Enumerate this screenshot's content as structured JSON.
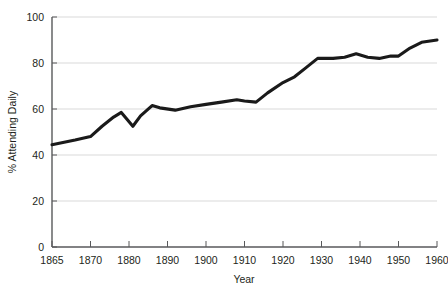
{
  "chart_data": {
    "type": "line",
    "title": "",
    "subtitle": "",
    "xlabel": "Year",
    "ylabel": "% Attending Daily",
    "xlim": [
      1865,
      1960
    ],
    "ylim": [
      0,
      100
    ],
    "grid": true,
    "legend": false,
    "legend_position": "none",
    "line_color": "#1a1a1a",
    "grid_color": "#d9d9d9",
    "axis_color": "#58595b",
    "x_tick_labels": [
      "1865",
      "1870",
      "1880",
      "1890",
      "1900",
      "1910",
      "1920",
      "1930",
      "1940",
      "1950",
      "1960"
    ],
    "y_tick_labels": [
      "0",
      "20",
      "40",
      "60",
      "80",
      "100"
    ],
    "y_ticks": [
      0,
      20,
      40,
      60,
      80,
      100
    ],
    "x_axis_scale": "categorical-even-spacing",
    "series": [
      {
        "name": "% Attending Daily",
        "x": [
          1865,
          1868,
          1870,
          1873,
          1876,
          1878,
          1881,
          1883,
          1886,
          1888,
          1892,
          1896,
          1900,
          1904,
          1908,
          1910,
          1913,
          1916,
          1920,
          1923,
          1926,
          1929,
          1933,
          1936,
          1939,
          1942,
          1945,
          1948,
          1950,
          1953,
          1956,
          1960
        ],
        "values": [
          44.5,
          46.5,
          48.0,
          52.5,
          56.5,
          58.5,
          52.5,
          57.0,
          61.5,
          60.5,
          59.5,
          61.0,
          62.0,
          63.0,
          64.0,
          63.5,
          63.0,
          67.0,
          71.5,
          74.0,
          78.0,
          82.0,
          82.0,
          82.5,
          84.0,
          82.5,
          82.0,
          83.0,
          83.0,
          86.5,
          89.0,
          90.0
        ]
      }
    ],
    "annotations": []
  },
  "axis": {
    "x_label": "Year",
    "y_label": "% Attending Daily"
  }
}
